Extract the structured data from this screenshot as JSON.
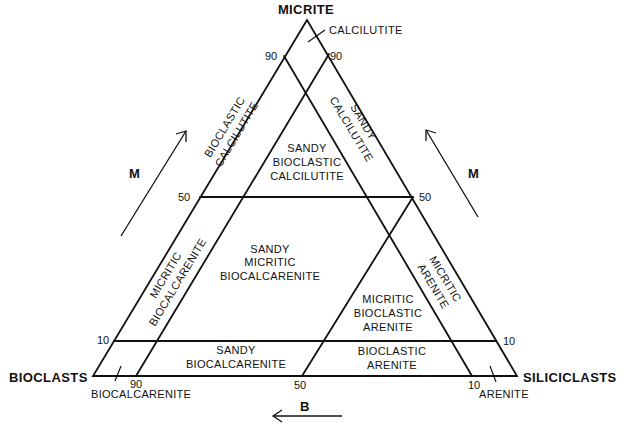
{
  "diagram": {
    "type": "ternary-classification",
    "vertices": {
      "top": "MICRITE",
      "left": "BIOCLASTS",
      "right": "SILICICLASTS"
    },
    "ticks": {
      "left_90": "90",
      "right_90": "90",
      "left_50": "50",
      "right_50": "50",
      "left_10": "10",
      "right_10": "10",
      "bottom_90": "90",
      "bottom_50": "50",
      "bottom_10": "10"
    },
    "axis_arrows": {
      "left_m": "M",
      "right_m": "M",
      "bottom_b": "B"
    },
    "fields": {
      "calcilutite": "CALCILUTITE",
      "bioclastic_calcilutite": [
        "BIOCLASTIC",
        "CALCILUTITE"
      ],
      "sandy_calcilutite": [
        "SANDY",
        "CALCILUTITE"
      ],
      "sandy_bioclastic_calcilutite": [
        "SANDY",
        "BIOCLASTIC",
        "CALCILUTITE"
      ],
      "micritic_biocalcarenite": [
        "MICRITIC",
        "BIOCALCARENITE"
      ],
      "sandy_micritic_biocalcarenite": [
        "SANDY",
        "MICRITIC",
        "BIOCALCARENITE"
      ],
      "micritic_arenite": [
        "MICRITIC",
        "ARENITE"
      ],
      "micritic_bioclastic_arenite": [
        "MICRITIC",
        "BIOCLASTIC",
        "ARENITE"
      ],
      "sandy_biocalcarenite": [
        "SANDY",
        "BIOCALCARENITE"
      ],
      "bioclastic_arenite": [
        "BIOCLASTIC",
        "ARENITE"
      ],
      "biocalcarenite": "BIOCALCARENITE",
      "arenite": "ARENITE"
    }
  }
}
